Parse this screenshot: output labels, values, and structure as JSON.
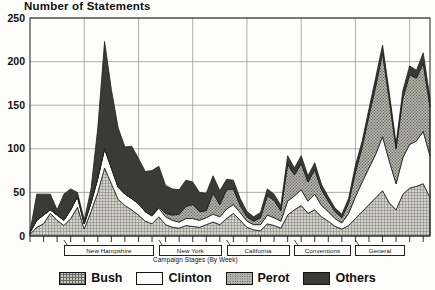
{
  "chart_data": {
    "type": "area",
    "stacked": true,
    "title": "Number of Statements",
    "xlabel": "Campaign Stages (By Week)",
    "ylabel": "",
    "ylim": [
      0,
      250
    ],
    "yticks": [
      0,
      50,
      100,
      150,
      200,
      250
    ],
    "grid": true,
    "legend_position": "bottom",
    "x_count": 60,
    "x_gridlines_at_index": [
      8,
      16,
      24,
      32,
      40,
      48,
      56
    ],
    "stage_labels": [
      "New Hampshire",
      "New York",
      "California",
      "Conventions",
      "General"
    ],
    "series": [
      {
        "name": "Bush",
        "color": "#c9c9c2",
        "pattern": "crosshatch",
        "values": [
          2,
          10,
          14,
          26,
          18,
          12,
          20,
          33,
          8,
          28,
          50,
          78,
          60,
          42,
          35,
          30,
          24,
          17,
          14,
          22,
          13,
          10,
          9,
          12,
          11,
          10,
          13,
          16,
          13,
          20,
          26,
          18,
          10,
          7,
          6,
          14,
          12,
          9,
          24,
          30,
          35,
          26,
          30,
          22,
          17,
          11,
          8,
          12,
          20,
          28,
          36,
          44,
          52,
          38,
          30,
          48,
          55,
          57,
          60,
          44
        ]
      },
      {
        "name": "Clinton",
        "color": "#fdfdfb",
        "pattern": "solid-white",
        "values": [
          2,
          8,
          10,
          4,
          6,
          6,
          10,
          12,
          6,
          10,
          16,
          22,
          18,
          14,
          13,
          13,
          13,
          11,
          9,
          10,
          9,
          8,
          7,
          8,
          9,
          8,
          8,
          9,
          9,
          11,
          10,
          9,
          7,
          6,
          7,
          10,
          9,
          8,
          16,
          16,
          18,
          14,
          18,
          13,
          11,
          9,
          7,
          14,
          25,
          34,
          42,
          50,
          62,
          48,
          30,
          42,
          50,
          52,
          60,
          48
        ]
      },
      {
        "name": "Perot",
        "color": "#b4b4ad",
        "pattern": "dots",
        "values": [
          0,
          0,
          0,
          0,
          0,
          0,
          0,
          0,
          0,
          0,
          0,
          0,
          0,
          0,
          0,
          0,
          0,
          0,
          0,
          2,
          4,
          6,
          9,
          14,
          16,
          10,
          8,
          24,
          14,
          22,
          18,
          8,
          5,
          4,
          8,
          22,
          20,
          12,
          42,
          24,
          30,
          22,
          28,
          18,
          12,
          8,
          6,
          12,
          28,
          40,
          60,
          78,
          96,
          70,
          40,
          68,
          80,
          72,
          78,
          56
        ]
      },
      {
        "name": "Others",
        "color": "#3a3a36",
        "pattern": "solid-dark",
        "values": [
          1,
          30,
          24,
          18,
          6,
          30,
          24,
          5,
          4,
          16,
          58,
          123,
          90,
          68,
          54,
          60,
          52,
          46,
          52,
          46,
          32,
          30,
          28,
          30,
          26,
          22,
          20,
          20,
          16,
          12,
          10,
          8,
          6,
          5,
          6,
          8,
          7,
          6,
          10,
          8,
          9,
          7,
          8,
          6,
          5,
          4,
          4,
          5,
          8,
          7,
          8,
          10,
          9,
          8,
          6,
          9,
          10,
          9,
          12,
          10
        ]
      }
    ]
  },
  "legend": {
    "items": [
      {
        "label": "Bush"
      },
      {
        "label": "Clinton"
      },
      {
        "label": "Perot"
      },
      {
        "label": "Others"
      }
    ]
  }
}
